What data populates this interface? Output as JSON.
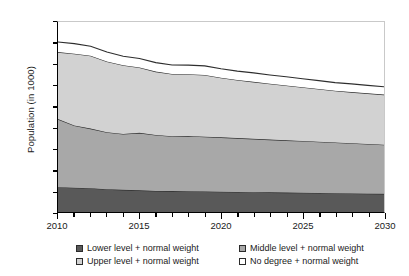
{
  "chart_data": {
    "type": "area",
    "stacked": true,
    "title": "",
    "xlabel": "",
    "ylabel": "Population (in 1000)",
    "ylim": [
      0,
      1800
    ],
    "ytick_step": 200,
    "ytick_labels": [
      "0",
      "200",
      "400",
      "600",
      "800",
      "1000",
      "1200",
      "1400",
      "1600",
      "1800"
    ],
    "xlim": [
      2010,
      2030
    ],
    "xtick_step": 1,
    "xtick_labels": [
      "2010",
      "2015",
      "2020",
      "2025",
      "2030"
    ],
    "xtick_label_years": [
      2010,
      2015,
      2020,
      2025,
      2030
    ],
    "grid": false,
    "legend_position": "bottom",
    "x": [
      2010,
      2011,
      2012,
      2013,
      2014,
      2015,
      2016,
      2017,
      2018,
      2019,
      2020,
      2021,
      2022,
      2023,
      2024,
      2025,
      2026,
      2027,
      2028,
      2029,
      2030
    ],
    "series": [
      {
        "name": "Lower level + normal weight",
        "color": "#595959",
        "values": [
          235,
          230,
          225,
          215,
          210,
          205,
          200,
          198,
          196,
          194,
          192,
          190,
          188,
          186,
          184,
          182,
          180,
          178,
          176,
          174,
          172
        ]
      },
      {
        "name": "Middle level + normal weight",
        "color": "#a8a8a8",
        "values": [
          645,
          590,
          565,
          540,
          530,
          545,
          530,
          520,
          525,
          520,
          515,
          510,
          505,
          500,
          495,
          490,
          485,
          480,
          475,
          470,
          465
        ]
      },
      {
        "name": "Upper level + normal weight",
        "color": "#d2d2d2",
        "values": [
          635,
          680,
          690,
          670,
          650,
          620,
          600,
          590,
          585,
          585,
          565,
          550,
          540,
          530,
          520,
          510,
          500,
          490,
          485,
          480,
          475
        ]
      },
      {
        "name": "No degree + normal weight",
        "color": "#ffffff",
        "values": [
          95,
          95,
          90,
          90,
          85,
          85,
          85,
          85,
          85,
          85,
          85,
          85,
          85,
          82,
          82,
          80,
          80,
          78,
          78,
          76,
          75
        ]
      }
    ],
    "totals": [
      1610,
      1595,
      1570,
      1515,
      1475,
      1455,
      1415,
      1393,
      1391,
      1384,
      1357,
      1335,
      1318,
      1298,
      1281,
      1262,
      1245,
      1226,
      1214,
      1200,
      1187
    ]
  },
  "legend": {
    "items": [
      {
        "label": "Lower level + normal weight",
        "color": "#595959"
      },
      {
        "label": "Middle level + normal weight",
        "color": "#a8a8a8"
      },
      {
        "label": "Upper level + normal weight",
        "color": "#d2d2d2"
      },
      {
        "label": "No degree + normal weight",
        "color": "#ffffff"
      }
    ]
  }
}
